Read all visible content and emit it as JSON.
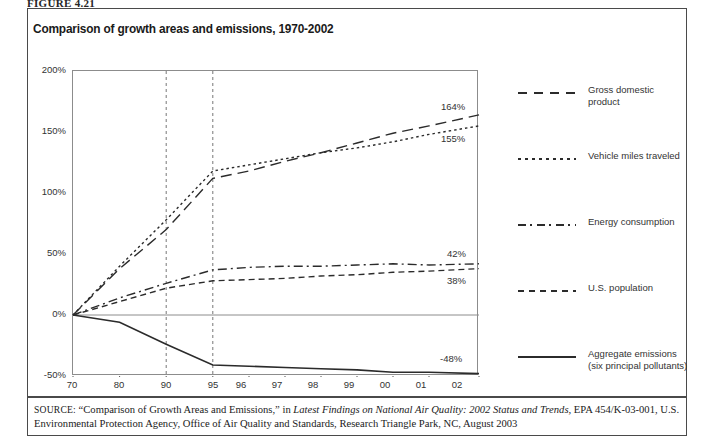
{
  "figure": {
    "tag": "FIGURE 4.21"
  },
  "chart_title": "Comparison of growth areas and emissions, 1970-2002",
  "axis": {
    "y_ticks": [
      "200%",
      "150%",
      "100%",
      "50%",
      "0%",
      "-50%"
    ],
    "x_ticks": [
      "70",
      "80",
      "90",
      "95",
      "96",
      "97",
      "98",
      "99",
      "00",
      "01",
      "02"
    ]
  },
  "legend": {
    "items": [
      {
        "label": "Gross domestic product",
        "style": "long-dash",
        "color": "#2b2b2b"
      },
      {
        "label": "Vehicle miles traveled",
        "style": "dotted",
        "color": "#2b2b2b"
      },
      {
        "label": "Energy consumption",
        "style": "dash-dot",
        "color": "#2b2b2b"
      },
      {
        "label": "U.S. population",
        "style": "short-dash",
        "color": "#2b2b2b"
      },
      {
        "label": "Aggregate emissions",
        "label2": "(six principal pollutants)",
        "style": "solid",
        "color": "#2b2b2b"
      }
    ]
  },
  "end_labels": {
    "gdp": "164%",
    "vmt": "155%",
    "energy": "42%",
    "population": "38%",
    "emissions": "-48%"
  },
  "source": {
    "prefix": "SOURCE:",
    "part1": " “Comparison of Growth Areas and Emissions,” in ",
    "italic": "Latest Findings on National Air Quality: 2002 Status and Trends,",
    "part2": " EPA 454/K-03-001, U.S. Environmental Protection Agency, Office of Air Quality and Standards, Research Triangle Park, NC, August 2003"
  },
  "chart_data": {
    "type": "line",
    "title": "Comparison of growth areas and emissions, 1970-2002",
    "xlabel": "",
    "ylabel": "",
    "ylim": [
      -50,
      200
    ],
    "grid": false,
    "legend_position": "right",
    "annotations": [
      "Vertical dashed reference lines at 1990 and 1995"
    ],
    "x": [
      "70",
      "80",
      "90",
      "95",
      "96",
      "97",
      "98",
      "99",
      "00",
      "01",
      "02"
    ],
    "series": [
      {
        "name": "Gross domestic product",
        "style": "long-dash",
        "values": [
          0,
          38,
          70,
          112,
          118,
          126,
          133,
          141,
          149,
          155,
          164
        ]
      },
      {
        "name": "Vehicle miles traveled",
        "style": "dotted",
        "values": [
          0,
          40,
          78,
          118,
          123,
          128,
          133,
          137,
          142,
          148,
          155
        ]
      },
      {
        "name": "Energy consumption",
        "style": "dash-dot",
        "values": [
          0,
          14,
          26,
          37,
          39,
          40,
          40,
          41,
          42,
          41,
          42
        ]
      },
      {
        "name": "U.S. population",
        "style": "short-dash",
        "values": [
          0,
          11,
          22,
          28,
          29,
          30,
          32,
          33,
          35,
          36,
          38
        ]
      },
      {
        "name": "Aggregate emissions (six principal pollutants)",
        "style": "solid",
        "values": [
          0,
          -6,
          -24,
          -41,
          -42,
          -43,
          -44,
          -45,
          -47,
          -47,
          -48
        ]
      }
    ]
  }
}
